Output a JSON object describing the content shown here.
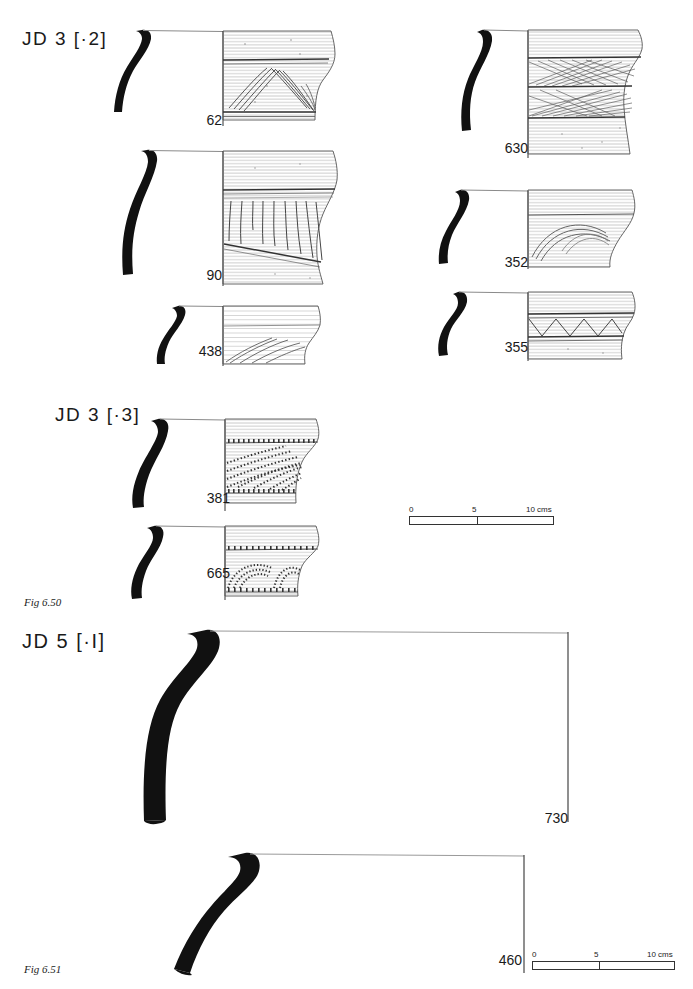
{
  "plate": {
    "background": "#ffffff",
    "ink": "#1a1a1a"
  },
  "sections": [
    {
      "id": "jd3-2",
      "label": "JD 3  [·2]"
    },
    {
      "id": "jd3-3",
      "label": "JD 3  [·3]"
    },
    {
      "id": "jd5-1",
      "label": "JD 5  [·I]"
    }
  ],
  "figures": [
    {
      "id": "fig-650",
      "caption": "Fig 6.50"
    },
    {
      "id": "fig-651",
      "caption": "Fig 6.51"
    }
  ],
  "vessels": [
    {
      "number": "62",
      "section": "jd3-2",
      "decoration": "chevron multi-line incised bands"
    },
    {
      "number": "90",
      "section": "jd3-2",
      "decoration": "vertical incised strokes above oblique line"
    },
    {
      "number": "438",
      "section": "jd3-2",
      "decoration": "oblique lines on lower body"
    },
    {
      "number": "630",
      "section": "jd3-2",
      "decoration": "crossed diagonal hatched bands"
    },
    {
      "number": "352",
      "section": "jd3-2",
      "decoration": "nested arcs"
    },
    {
      "number": "355",
      "section": "jd3-2",
      "decoration": "zigzag triangle band"
    },
    {
      "number": "381",
      "section": "jd3-3",
      "decoration": "comb-impressed diagonal bands"
    },
    {
      "number": "665",
      "section": "jd3-3",
      "decoration": "comb-impressed nested arcs"
    },
    {
      "number": "730",
      "section": "jd5-1",
      "decoration": "plain"
    },
    {
      "number": "460",
      "section": "jd5-1",
      "decoration": "plain"
    }
  ],
  "scalebars": [
    {
      "id": "scale-650",
      "ticks": [
        "0",
        "5",
        "10 cms"
      ]
    },
    {
      "id": "scale-651",
      "ticks": [
        "0",
        "5",
        "10 cms"
      ]
    }
  ]
}
